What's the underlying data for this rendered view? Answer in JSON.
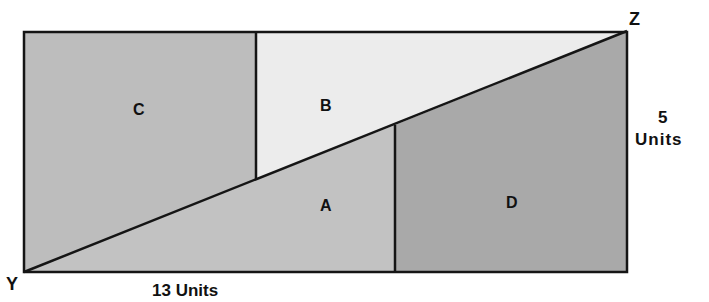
{
  "diagram": {
    "regions": [
      {
        "id": "A",
        "label": "A",
        "color": "#c2c2c2"
      },
      {
        "id": "B",
        "label": "B",
        "color": "#ececec"
      },
      {
        "id": "C",
        "label": "C",
        "color": "#bdbdbd"
      },
      {
        "id": "D",
        "label": "D",
        "color": "#a9a9a9"
      }
    ],
    "vertices": {
      "bottom_left": "Y",
      "top_right": "Z"
    },
    "dimensions": {
      "width_label": "13 Units",
      "height_value": "5",
      "height_unit": "Units"
    },
    "line_color": "#151515"
  }
}
